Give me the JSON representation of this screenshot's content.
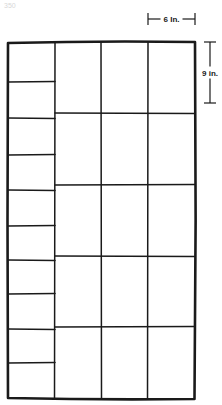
{
  "page_mark": "350",
  "diagram": {
    "outer_frame": {
      "x": 8,
      "y": 42,
      "width": 187,
      "height": 357
    },
    "stroke_color": "#1a1a1a",
    "columns_x": [
      8,
      55,
      101,
      148,
      195
    ],
    "left_column": {
      "x_start": 8,
      "x_end": 55,
      "row_lines_y": [
        82,
        118,
        155,
        190,
        226,
        260,
        294,
        329,
        363
      ],
      "row_count": 10
    },
    "main_grid": {
      "x_start": 55,
      "x_end": 195,
      "row_lines_y": [
        113,
        185,
        256,
        327
      ],
      "row_count": 5,
      "column_count": 3
    },
    "dimensions": {
      "width": {
        "label": "6 In.",
        "x1": 148,
        "x2": 195,
        "y": 19
      },
      "height": {
        "label": "9 in.",
        "x": 210,
        "y1": 42,
        "y2": 103
      }
    }
  }
}
